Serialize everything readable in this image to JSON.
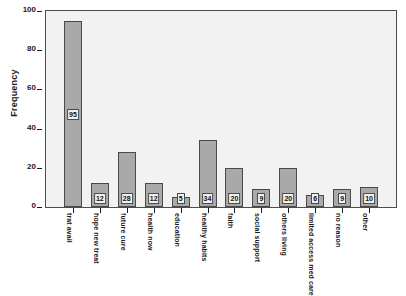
{
  "chart_data": {
    "type": "bar",
    "title": "",
    "xlabel": "",
    "ylabel": "Frequency",
    "ylim": [
      0,
      100
    ],
    "yticks": [
      0,
      20,
      40,
      60,
      80,
      100
    ],
    "grid": false,
    "legend": "none",
    "bar_color": "#a9a9a9",
    "bar_edge_color": "#4a4a4a",
    "plot_background": "#f2f2f2",
    "categories": [
      "trat avail",
      "hope new treat",
      "future cure",
      "health now",
      "education",
      "healthy habits",
      "faith",
      "social support",
      "others living",
      "limited access med care",
      "no reason",
      "other"
    ],
    "values": [
      95,
      12,
      28,
      12,
      5,
      34,
      20,
      9,
      20,
      6,
      9,
      10
    ],
    "data_labels": [
      "95",
      "12",
      "28",
      "12",
      "5",
      "34",
      "20",
      "9",
      "20",
      "6",
      "9",
      "10"
    ]
  }
}
